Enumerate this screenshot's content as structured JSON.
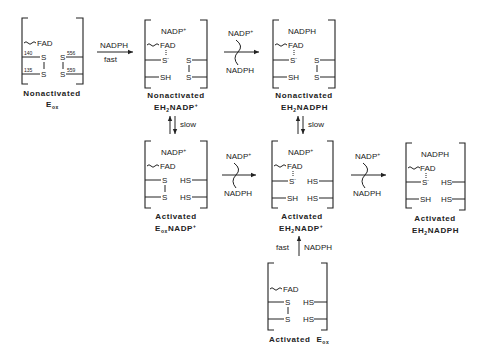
{
  "states": [
    {
      "id": "nonactivated-eox",
      "label_line1": "Nonactivated",
      "label_line2_main": "E",
      "label_line2_sub": "ox",
      "label_line2_sup": "",
      "cofactor": "",
      "fad": "FAD",
      "left_top": "S",
      "left_bottom": "S",
      "right_top": "S",
      "right_bottom": "S",
      "residues": [
        "140",
        "135",
        "556",
        "559"
      ]
    },
    {
      "id": "nonactivated-eh2nadp",
      "label_line1": "Nonactivated",
      "label_line2_main": "EH",
      "label_line2_sub": "2",
      "label_line2_rest": "NADP",
      "label_line2_sup": "+",
      "cofactor": "NADP",
      "cofactor_sup": "+",
      "fad": "FAD",
      "left_top": "S",
      "left_top_sup": "-",
      "left_bottom": "SH",
      "right_top": "S",
      "right_bottom": "S"
    },
    {
      "id": "nonactivated-eh2nadph",
      "label_line1": "Nonactivated",
      "label_line2_main": "EH",
      "label_line2_sub": "2",
      "label_line2_rest": "NADPH",
      "cofactor": "NADPH",
      "fad": "FAD",
      "left_top": "S",
      "left_top_sup": "-",
      "left_bottom": "SH",
      "right_top": "S",
      "right_bottom": "S"
    },
    {
      "id": "activated-eoxnadp",
      "label_line1": "Activated",
      "label_line2_main": "E",
      "label_line2_sub": "ox",
      "label_line2_rest": "NADP",
      "label_line2_sup": "+",
      "cofactor": "NADP",
      "cofactor_sup": "+",
      "fad": "FAD",
      "left_top": "S",
      "left_bottom": "S",
      "right_top": "HS",
      "right_bottom": "HS"
    },
    {
      "id": "activated-eh2nadp",
      "label_line1": "Activated",
      "label_line2_main": "EH",
      "label_line2_sub": "2",
      "label_line2_rest": "NADP",
      "label_line2_sup": "+",
      "cofactor": "NADP",
      "cofactor_sup": "+",
      "fad": "FAD",
      "left_top": "S",
      "left_top_sup": "-",
      "left_bottom": "SH",
      "right_top": "HS",
      "right_bottom": "HS"
    },
    {
      "id": "activated-eh2nadph",
      "label_line1": "Activated",
      "label_line2_main": "EH",
      "label_line2_sub": "2",
      "label_line2_rest": "NADPH",
      "cofactor": "NADPH",
      "fad": "FAD",
      "left_top": "S",
      "left_top_sup": "-",
      "left_bottom": "SH",
      "right_top": "HS",
      "right_bottom": "HS"
    },
    {
      "id": "activated-eox",
      "label_line1": "Activated",
      "label_line2_main": "E",
      "label_line2_sub": "ox",
      "fad": "FAD",
      "left_top": "S",
      "left_bottom": "S",
      "right_top": "HS",
      "right_bottom": "HS"
    }
  ],
  "arrows": {
    "a1": {
      "top": "NADPH",
      "bottom": "fast"
    },
    "exchange": {
      "top": "NADP",
      "top_sup": "+",
      "bottom": "NADPH"
    },
    "slow": "slow",
    "up": {
      "left": "fast",
      "right": "NADPH"
    }
  }
}
